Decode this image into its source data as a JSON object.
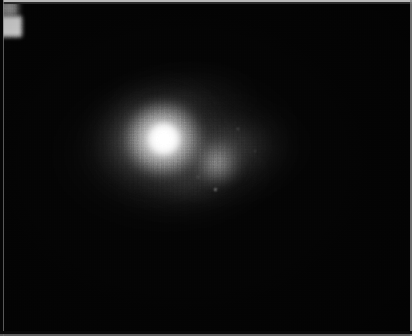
{
  "image": {
    "kind": "astronomical-grayscale-frame",
    "description": "Grayscale astronomical detector image of a compact bright source with a fainter secondary knot and extended diffuse emission",
    "colormap": "grayscale",
    "width_px": 412,
    "height_px": 336,
    "background_color": "#000000",
    "peak_color": "#ffffff",
    "border_color": "#b9b9b9"
  },
  "features": {
    "nucleus": {
      "name": "primary-nucleus",
      "center_x": 164,
      "center_y": 139,
      "peak_level": "saturated-white",
      "fwhm_px": 28
    },
    "knot": {
      "name": "secondary-knot",
      "center_x": 217,
      "center_y": 163,
      "peak_level": "mid-gray",
      "fwhm_px": 18
    },
    "halo": {
      "name": "diffuse-envelope",
      "center_x": 188,
      "center_y": 146,
      "extent_x_px": 300,
      "extent_y_px": 196,
      "position_angle_deg": -6
    },
    "points": [
      {
        "name": "point-source-a",
        "x": 215,
        "y": 189
      },
      {
        "name": "point-source-b",
        "x": 238,
        "y": 129
      },
      {
        "name": "point-source-c",
        "x": 198,
        "y": 177
      },
      {
        "name": "point-source-d",
        "x": 255,
        "y": 151
      }
    ]
  },
  "noise": {
    "pattern": "vertical-striping-and-pixel-mottle",
    "readout_direction": "vertical"
  },
  "frame": {
    "top_edge_color": "#b9b9b9",
    "left_edge_color": "#777777",
    "right_edge_color": "#8a8a8a",
    "bottom_edge_color": "#6f6f6f"
  }
}
